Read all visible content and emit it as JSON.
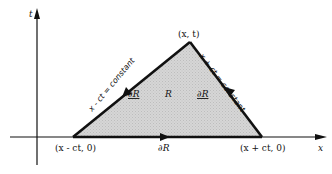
{
  "diagram": {
    "axes": {
      "vertical_label": "t",
      "horizontal_label": "x"
    },
    "vertices": {
      "apex": "(x, t)",
      "left_base": "(x - ct, 0)",
      "right_base": "(x + ct, 0)"
    },
    "region": {
      "label": "R",
      "fill_color": "#d4d4d4"
    },
    "boundary": {
      "label_base": "∂R",
      "label_left_side": "∂R",
      "label_right_side": "∂R"
    },
    "characteristics": {
      "left": "x - ct = constant",
      "right": "x + ct = constant"
    },
    "colors": {
      "line": "#111111",
      "background": "#ffffff"
    }
  }
}
